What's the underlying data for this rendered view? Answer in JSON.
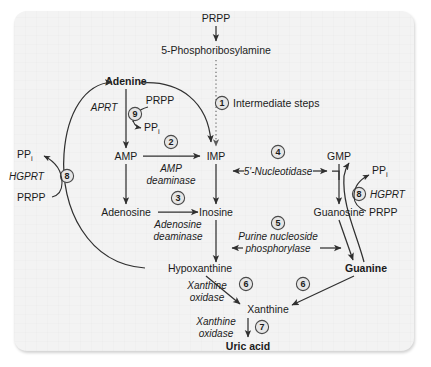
{
  "figure": {
    "panel_background": "#f3f3f3",
    "line_color": "#303030",
    "text_color": "#1b1b1b"
  },
  "metabolites": {
    "prpp_top": "PRPP",
    "phosphoribosylamine": "5-Phosphoribosylamine",
    "adenine": "Adenine",
    "prpp_aprt": "PRPP",
    "ppi_aprt": "PP",
    "ppi_aprt_sub": "i",
    "amp": "AMP",
    "imp": "IMP",
    "gmp": "GMP",
    "adenosine": "Adenosine",
    "inosine": "Inosine",
    "guanosine": "Guanosine",
    "hypoxanthine": "Hypoxanthine",
    "guanine": "Guanine",
    "xanthine": "Xanthine",
    "uric_acid": "Uric acid",
    "ppi_left": "PP",
    "ppi_left_sub": "i",
    "prpp_left": "PRPP",
    "ppi_right": "PP",
    "ppi_right_sub": "i",
    "prpp_right": "PRPP"
  },
  "enzymes": {
    "aprt": "APRT",
    "hgprt_left": "HGPRT",
    "hgprt_right": "HGPRT",
    "amp_deaminase_l1": "AMP",
    "amp_deaminase_l2": "deaminase",
    "nucleotidase": "5'-Nucleotidase",
    "adenosine_deaminase_l1": "Adenosine",
    "adenosine_deaminase_l2": "deaminase",
    "pnp_l1": "Purine nucleoside",
    "pnp_l2": "phosphorylase",
    "xanthine_oxidase_a_l1": "Xanthine",
    "xanthine_oxidase_a_l2": "oxidase",
    "xanthine_oxidase_b_l1": "Xanthine",
    "xanthine_oxidase_b_l2": "oxidase"
  },
  "steps": [
    {
      "number": "1",
      "label": "Intermediate steps"
    },
    {
      "number": "2",
      "label": ""
    },
    {
      "number": "3",
      "label": ""
    },
    {
      "number": "4",
      "label": ""
    },
    {
      "number": "5",
      "label": ""
    },
    {
      "number": "6",
      "label": ""
    },
    {
      "number": "6b",
      "label": ""
    },
    {
      "number": "7",
      "label": ""
    },
    {
      "number": "8",
      "label": ""
    },
    {
      "number": "8b",
      "label": ""
    },
    {
      "number": "9",
      "label": ""
    }
  ],
  "step_numbers": {
    "n1": "1",
    "n2": "2",
    "n3": "3",
    "n4": "4",
    "n5": "5",
    "n6a": "6",
    "n6b": "6",
    "n7": "7",
    "n8_left": "8",
    "n8_right": "8",
    "n9": "9"
  },
  "annotations": {
    "intermediate_steps": "Intermediate steps"
  }
}
